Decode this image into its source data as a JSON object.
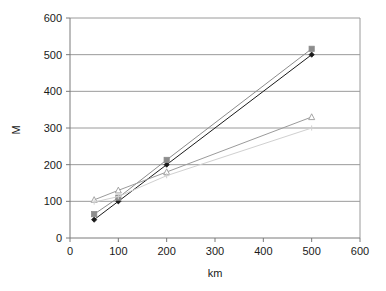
{
  "chart_data": {
    "type": "line",
    "title": "",
    "subtitle": "",
    "xlabel": "km",
    "ylabel": "M",
    "xlim": [
      0,
      600
    ],
    "ylim": [
      0,
      600
    ],
    "xticks": [
      0,
      100,
      200,
      300,
      400,
      500,
      600
    ],
    "yticks": [
      0,
      100,
      200,
      300,
      400,
      500,
      600
    ],
    "grid": "horizontal",
    "legend": "none",
    "x": [
      50,
      100,
      200,
      500
    ],
    "series": [
      {
        "name": "series-1",
        "marker": "filled-diamond",
        "color": "#1a1a1a",
        "values": [
          50,
          100,
          200,
          500
        ]
      },
      {
        "name": "series-2",
        "marker": "filled-square",
        "color": "#8c8c8c",
        "values": [
          65,
          110,
          213,
          516
        ]
      },
      {
        "name": "series-3",
        "marker": "open-triangle",
        "color": "#9b9b9b",
        "values": [
          104,
          130,
          180,
          330
        ]
      },
      {
        "name": "series-4",
        "marker": "plus",
        "color": "#d0d0d0",
        "values": [
          98,
          113,
          170,
          300
        ]
      }
    ]
  },
  "axis": {
    "x_tick_labels": [
      "0",
      "100",
      "200",
      "300",
      "400",
      "500",
      "600"
    ],
    "y_tick_labels": [
      "0",
      "100",
      "200",
      "300",
      "400",
      "500",
      "600"
    ],
    "x_title": "km",
    "y_title": "M"
  }
}
